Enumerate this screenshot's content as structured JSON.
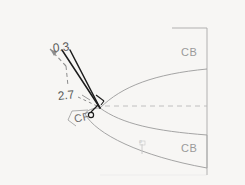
{
  "figure": {
    "background_color": "#f7f6f4",
    "title_visible": false,
    "labels": {
      "cb_top": "CB",
      "cb_bottom": "CB",
      "cf": "CF",
      "dim_upper": "0.3",
      "dim_lower": "2.7",
      "tick_small": "o"
    },
    "colors": {
      "curve": "#9b9b9b",
      "border": "#a8a8a8",
      "axis_dashed": "#b9b9b9",
      "ray_solid": "#1d1d1d",
      "ray_dashed": "#8d8d8d",
      "label_gray": "#9a9a9a",
      "label_dark": "#5a5a5a"
    },
    "geometry": {
      "focus_point": {
        "x": 100,
        "y": 108
      },
      "axis_y": 106,
      "right_border_x": 207,
      "top_border_y": 28,
      "bottom_border_y": 175
    }
  }
}
